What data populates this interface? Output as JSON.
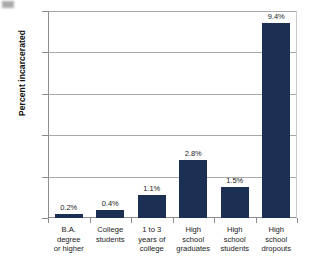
{
  "chart_data": {
    "type": "bar",
    "title": "",
    "xlabel": "",
    "ylabel": "Percent incarcerated",
    "ylim": [
      0,
      10
    ],
    "yticks": [
      0,
      2,
      4,
      6,
      8,
      10
    ],
    "ytick_labels": [
      "0",
      "2",
      "4",
      "6",
      "8",
      "10"
    ],
    "grid": true,
    "legend": false,
    "bar_color": "#1b2f52",
    "categories": [
      "B.A. degree or higher",
      "College students",
      "1 to 3 years of college",
      "High school graduates",
      "High school students",
      "High school dropouts"
    ],
    "category_lines": [
      [
        "B.A.",
        "degree",
        "or higher"
      ],
      [
        "College",
        "students"
      ],
      [
        "1 to 3",
        "years of",
        "college"
      ],
      [
        "High",
        "school",
        "graduates"
      ],
      [
        "High",
        "school",
        "students"
      ],
      [
        "High",
        "school",
        "dropouts"
      ]
    ],
    "values": [
      0.2,
      0.4,
      1.1,
      2.8,
      1.5,
      9.4
    ],
    "value_labels": [
      "0.2%",
      "0.4%",
      "1.1%",
      "2.8%",
      "1.5%",
      "9.4%"
    ]
  }
}
